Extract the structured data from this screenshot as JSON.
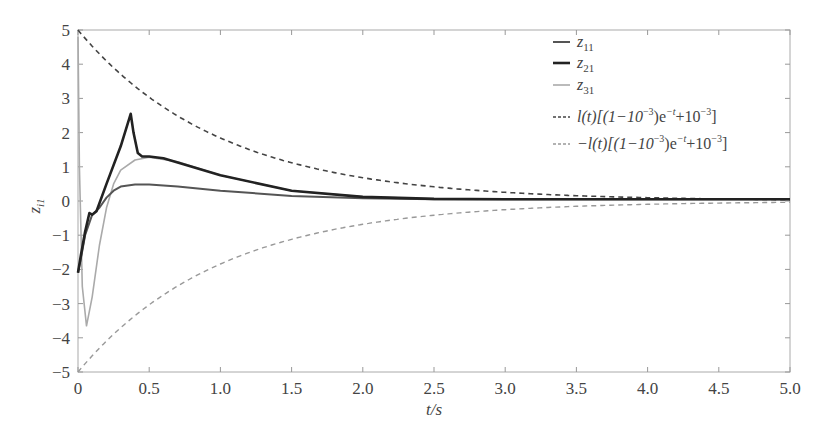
{
  "chart_data": {
    "type": "line",
    "title": "",
    "xlabel": "t/s",
    "ylabel": "z_i1",
    "xlim": [
      0,
      5.0
    ],
    "ylim": [
      -5,
      5
    ],
    "grid": false,
    "legend_position": "upper right (inside)",
    "x_ticks": [
      "0",
      "0.5",
      "1.0",
      "1.5",
      "2.0",
      "2.5",
      "3.0",
      "3.5",
      "4.0",
      "4.5",
      "5.0"
    ],
    "y_ticks": [
      "5",
      "4",
      "3",
      "2",
      "1",
      "0",
      "−1",
      "−2",
      "−3",
      "−4",
      "−5"
    ],
    "series": [
      {
        "name": "z11",
        "style": "solid, medium gray",
        "color": "#555555",
        "x": [
          0,
          0.02,
          0.05,
          0.1,
          0.15,
          0.2,
          0.25,
          0.3,
          0.4,
          0.5,
          0.7,
          1.0,
          1.5,
          2.0,
          2.5,
          3.0,
          4.0,
          5.0
        ],
        "y": [
          -2.1,
          -1.7,
          -1.0,
          -0.4,
          -0.2,
          0.1,
          0.3,
          0.42,
          0.48,
          0.48,
          0.42,
          0.3,
          0.15,
          0.08,
          0.05,
          0.05,
          0.05,
          0.05
        ]
      },
      {
        "name": "z21",
        "style": "solid, thick black",
        "color": "#222222",
        "x": [
          0,
          0.02,
          0.05,
          0.08,
          0.1,
          0.13,
          0.2,
          0.3,
          0.37,
          0.39,
          0.42,
          0.45,
          0.5,
          0.6,
          0.8,
          1.0,
          1.5,
          2.0,
          2.5,
          3.0,
          4.0,
          5.0
        ],
        "y": [
          -2.1,
          -1.6,
          -0.9,
          -0.35,
          -0.4,
          -0.3,
          0.5,
          1.6,
          2.55,
          2.0,
          1.4,
          1.3,
          1.3,
          1.25,
          1.0,
          0.75,
          0.3,
          0.12,
          0.06,
          0.05,
          0.05,
          0.05
        ]
      },
      {
        "name": "z31",
        "style": "solid, light gray",
        "color": "#aaaaaa",
        "x": [
          0,
          0.01,
          0.03,
          0.06,
          0.1,
          0.15,
          0.2,
          0.25,
          0.3,
          0.4,
          0.5,
          0.7,
          1.0,
          1.5,
          2.0,
          2.5,
          3.0,
          4.0,
          5.0
        ],
        "y": [
          4.8,
          1.0,
          -2.5,
          -3.65,
          -2.8,
          -1.3,
          -0.2,
          0.5,
          0.9,
          1.2,
          1.28,
          1.15,
          0.75,
          0.3,
          0.12,
          0.06,
          0.05,
          0.05,
          0.05
        ]
      },
      {
        "name": "l(t)[(1−10^−3)e^−t+10^−3]",
        "style": "dashed, dark",
        "color": "#444444",
        "formula": "5*((1-0.001)*exp(-t)+0.001)",
        "x": [
          0,
          0.5,
          1.0,
          1.5,
          2.0,
          2.5,
          3.0,
          3.5,
          4.0,
          4.5,
          5.0
        ],
        "y": [
          5.0,
          3.03,
          1.84,
          1.12,
          0.68,
          0.41,
          0.25,
          0.16,
          0.1,
          0.06,
          0.04
        ]
      },
      {
        "name": "−l(t)[(1−10^−3)e^−t+10^−3]",
        "style": "dashed, light gray",
        "color": "#999999",
        "formula": "-5*((1-0.001)*exp(-t)+0.001)",
        "x": [
          0,
          0.5,
          1.0,
          1.5,
          2.0,
          2.5,
          3.0,
          3.5,
          4.0,
          4.5,
          5.0
        ],
        "y": [
          -5.0,
          -3.03,
          -1.84,
          -1.12,
          -0.68,
          -0.41,
          -0.25,
          -0.16,
          -0.1,
          -0.06,
          -0.04
        ]
      }
    ]
  },
  "legend": {
    "items": [
      {
        "base": "z",
        "sub": "11"
      },
      {
        "base": "z",
        "sub": "21"
      },
      {
        "base": "z",
        "sub": "31"
      },
      {
        "prefix": "",
        "text": "l(t)[(1−10",
        "exp1": "−3",
        "mid": ")e",
        "exp2": "−t",
        "tail": "+10",
        "exp3": "−3",
        "end": "]"
      },
      {
        "prefix": "−",
        "text": "l(t)[(1−10",
        "exp1": "−3",
        "mid": ")e",
        "exp2": "−t",
        "tail": "+10",
        "exp3": "−3",
        "end": "]"
      }
    ]
  },
  "axes": {
    "xlabel": "t/s",
    "ylabel_base": "z",
    "ylabel_sub": "i1"
  }
}
